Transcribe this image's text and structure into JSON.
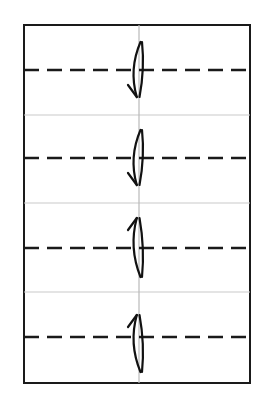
{
  "figure": {
    "kind": "schematic-diagram",
    "canvas": {
      "width": 270,
      "height": 409,
      "background": "#ffffff"
    },
    "plate": {
      "name": "plate-outline",
      "x": 24,
      "y": 25,
      "width": 226,
      "height": 358,
      "stroke": "#1a1a1a",
      "stroke_width": 2,
      "fill": "#ffffff"
    },
    "center_axis": {
      "name": "vertical-center-line",
      "x": 139,
      "y1": 25,
      "y2": 383,
      "stroke": "#b9b9b9",
      "stroke_width": 1.2,
      "style": "solid"
    },
    "band_dividers": {
      "name": "band-divider-lines",
      "stroke": "#c9c9c9",
      "stroke_width": 1.2,
      "style": "solid",
      "y_positions": [
        115,
        203,
        292
      ],
      "x1": 24,
      "x2": 250
    },
    "dashed_lines": {
      "name": "dashed-midlines",
      "stroke": "#1a1a1a",
      "stroke_width": 2.4,
      "style": "dashed",
      "dash_length": 15,
      "dash_gap": 8,
      "x1": 24,
      "x2": 250,
      "y_positions": [
        70,
        158,
        248,
        337
      ]
    },
    "arrows": [
      {
        "name": "arrow-band-1",
        "direction": "down",
        "band": 1,
        "center_x": 139,
        "top_y": 42,
        "bottom_y": 97,
        "stroke": "#111111",
        "stroke_width": 2.2
      },
      {
        "name": "arrow-band-2",
        "direction": "down",
        "band": 2,
        "center_x": 139,
        "top_y": 130,
        "bottom_y": 185,
        "stroke": "#111111",
        "stroke_width": 2.2
      },
      {
        "name": "arrow-band-3",
        "direction": "up",
        "band": 3,
        "center_x": 139,
        "top_y": 218,
        "bottom_y": 277,
        "stroke": "#111111",
        "stroke_width": 2.2
      },
      {
        "name": "arrow-band-4",
        "direction": "up",
        "band": 4,
        "center_x": 139,
        "top_y": 315,
        "bottom_y": 372,
        "stroke": "#111111",
        "stroke_width": 2.2
      }
    ],
    "bands": [
      {
        "index": 1,
        "label": "",
        "y_top": 25,
        "y_bottom": 115
      },
      {
        "index": 2,
        "label": "",
        "y_top": 115,
        "y_bottom": 203
      },
      {
        "index": 3,
        "label": "",
        "y_top": 203,
        "y_bottom": 292
      },
      {
        "index": 4,
        "label": "",
        "y_top": 292,
        "y_bottom": 383
      }
    ],
    "labels": []
  }
}
